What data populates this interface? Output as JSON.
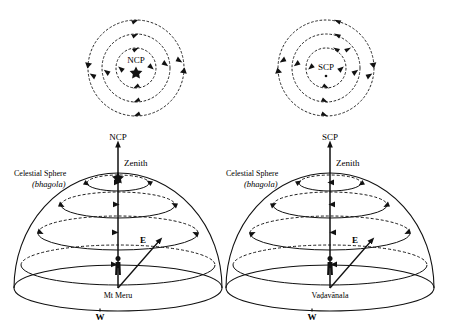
{
  "figure": {
    "title_implied": "Diurnal motion of stars seen from the north and south celestial poles and from Mt Meru / Vadavanala",
    "background_color": "#ffffff",
    "ink_color": "#111111"
  },
  "panels": {
    "top_left": {
      "name": "north-celestial-pole-plan-view",
      "center_label": "NCP",
      "center_marker": "star",
      "rotation": "clockwise",
      "circle_count": 3
    },
    "top_right": {
      "name": "south-celestial-pole-plan-view",
      "center_label": "SCP",
      "center_marker": "dot",
      "rotation": "counterclockwise",
      "circle_count": 3
    },
    "bottom_left": {
      "name": "mt-meru-celestial-sphere",
      "pole_label": "NCP",
      "zenith_label": "Zenith",
      "sphere_label_line1": "Celestial Sphere",
      "sphere_label_line2": "(bhagola)",
      "sphere_label_italic_part": "bhagola",
      "observer_label": "Mt Meru",
      "east_label": "E",
      "west_label": "W",
      "pole_star_marker": "star",
      "latitude_circle_count": 4
    },
    "bottom_right": {
      "name": "vadavanala-celestial-sphere",
      "pole_label": "SCP",
      "zenith_label": "Zenith",
      "sphere_label_line1": "Celestial Sphere",
      "sphere_label_line2": "(bhagola)",
      "sphere_label_italic_part": "bhagola",
      "observer_label": "Vaḍavānala",
      "east_label": "E",
      "west_label": "W",
      "pole_star_marker": "none",
      "latitude_circle_count": 4
    }
  }
}
